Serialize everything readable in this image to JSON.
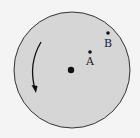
{
  "diagram": {
    "type": "rotating disk",
    "colors": {
      "disk_fill": "#d6d6d6",
      "disk_stroke": "#333333",
      "ink": "#111111",
      "background": "#f4f4f4"
    },
    "disk": {
      "cx": 72,
      "cy": 70,
      "r": 58
    },
    "center_point": {
      "x": 71,
      "y": 70
    },
    "points": [
      {
        "label": "A",
        "x": 90,
        "y": 52,
        "label_x": 86,
        "label_y": 65
      },
      {
        "label": "B",
        "x": 108,
        "y": 33,
        "label_x": 104,
        "label_y": 47
      }
    ],
    "rotation_arrow": {
      "direction": "counterclockwise"
    }
  }
}
